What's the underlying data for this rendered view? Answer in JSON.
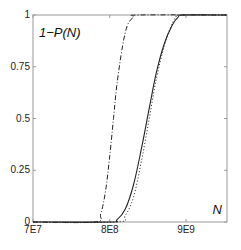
{
  "chart_data": {
    "type": "line",
    "title": "",
    "annotations": {
      "top_left": "1−P(N)",
      "bottom_right": "N"
    },
    "xlabel": "N",
    "ylabel": "1−P(N)",
    "xscale": "log",
    "xlim": [
      70000000.0,
      33000000000.0
    ],
    "ylim": [
      0,
      1
    ],
    "xticks": [
      {
        "value": 70000000.0,
        "label": "7E7"
      },
      {
        "value": 800000000.0,
        "label": "8E8"
      },
      {
        "value": 9000000000.0,
        "label": "9E9"
      }
    ],
    "yticks": [
      {
        "value": 0,
        "label": "0"
      },
      {
        "value": 0.25,
        "label": "0.25"
      },
      {
        "value": 0.5,
        "label": "0.5"
      },
      {
        "value": 0.75,
        "label": "0.75"
      },
      {
        "value": 1,
        "label": "1"
      }
    ],
    "grid": false,
    "legend": null,
    "series": [
      {
        "name": "dash-dot",
        "style": "dashdot",
        "x": [
          500000000.0,
          600000000.0,
          700000000.0,
          800000000.0,
          900000000.0,
          1000000000.0,
          1200000000.0,
          1400000000.0,
          1700000000.0,
          2000000000.0
        ],
        "y": [
          0.0,
          0.04,
          0.15,
          0.32,
          0.5,
          0.66,
          0.85,
          0.95,
          0.99,
          1.0
        ]
      },
      {
        "name": "solid",
        "style": "solid",
        "x": [
          800000000.0,
          1000000000.0,
          1300000000.0,
          1700000000.0,
          2200000000.0,
          2800000000.0,
          3500000000.0,
          4500000000.0,
          5800000000.0,
          7000000000.0,
          8500000000.0
        ],
        "y": [
          0.0,
          0.01,
          0.06,
          0.18,
          0.36,
          0.55,
          0.72,
          0.86,
          0.95,
          0.99,
          1.0
        ]
      },
      {
        "name": "dotted",
        "style": "dotted",
        "x": [
          1000000000.0,
          1300000000.0,
          1700000000.0,
          2200000000.0,
          2800000000.0,
          3500000000.0,
          4500000000.0,
          5500000000.0,
          6500000000.0,
          7500000000.0
        ],
        "y": [
          0.0,
          0.03,
          0.12,
          0.3,
          0.5,
          0.69,
          0.85,
          0.94,
          0.99,
          1.0
        ]
      }
    ]
  }
}
